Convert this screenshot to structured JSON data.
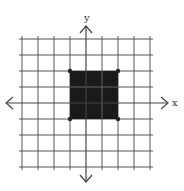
{
  "diagram": {
    "type": "coordinate-plane",
    "x_axis_label": "x",
    "y_axis_label": "y",
    "grid": {
      "x_range": [
        -4,
        4
      ],
      "y_range": [
        -4,
        4
      ],
      "cell_px": 16,
      "line_color": "#555555"
    },
    "shape": {
      "type": "square",
      "fill_color": "#1a1a1a",
      "vertices": [
        [
          -1,
          2
        ],
        [
          2,
          2
        ],
        [
          2,
          -1
        ],
        [
          -1,
          -1
        ]
      ]
    },
    "colors": {
      "axis": "#444444",
      "background": "#ffffff"
    }
  }
}
